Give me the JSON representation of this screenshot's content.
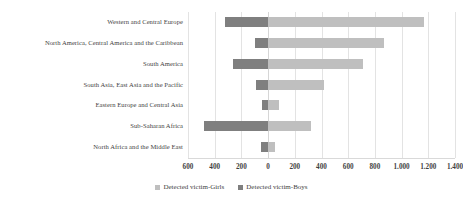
{
  "chart_data": {
    "type": "bar",
    "orientation": "horizontal",
    "stacked": "diverging",
    "title": "",
    "subtitle": "",
    "xlabel": "",
    "ylabel": "",
    "grid": true,
    "legend_position": "bottom",
    "xlim": [
      -600,
      1400
    ],
    "xticks": [
      -600,
      -400,
      -200,
      0,
      200,
      400,
      600,
      800,
      1000,
      1200,
      1400
    ],
    "xtick_labels": [
      "600",
      "400",
      "200",
      "0",
      "200",
      "400",
      "600",
      "800",
      "1.000",
      "1.200",
      "1.400"
    ],
    "categories": [
      "Western and Central Europe",
      "North America, Central America and the Caribbean",
      "South America",
      "South Asia, East Asia and the Pacific",
      "Eastern Europe and Central Asia",
      "Sub-Saharan Africa",
      "North Africa and the Middle East"
    ],
    "series": [
      {
        "name": "Detected victim-Boys",
        "color": "#7f7f7f",
        "direction": "left",
        "values": [
          320,
          95,
          265,
          90,
          45,
          480,
          50
        ]
      },
      {
        "name": "Detected victim-Girls",
        "color": "#bfbfbf",
        "direction": "right",
        "values": [
          1170,
          870,
          710,
          420,
          80,
          320,
          55
        ]
      }
    ]
  },
  "legend": {
    "items": [
      {
        "label": "Detected victim-Girls",
        "color": "#bfbfbf"
      },
      {
        "label": "Detected victim-Boys",
        "color": "#7f7f7f"
      }
    ]
  },
  "colors": {
    "girls": "#bfbfbf",
    "boys": "#7f7f7f",
    "grid": "#e3e3e3",
    "text": "#3f3f3f",
    "background": "#ffffff"
  }
}
